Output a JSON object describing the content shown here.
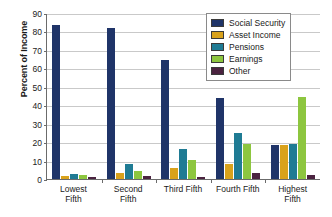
{
  "chart_data": {
    "type": "bar",
    "title": "",
    "xlabel": "",
    "ylabel": "Percent of Income",
    "ylim": [
      0,
      90
    ],
    "yticks": [
      0,
      10,
      20,
      30,
      40,
      50,
      60,
      70,
      80,
      90
    ],
    "grid": true,
    "legend_position": "top-right",
    "categories": [
      "Lowest Fifth",
      "Second Fifth",
      "Third Fifth",
      "Fourth Fifth",
      "Highest Fifth"
    ],
    "category_lines": [
      [
        "Lowest",
        "Fifth"
      ],
      [
        "Second",
        "Fifth"
      ],
      [
        "Third Fifth",
        ""
      ],
      [
        "Fourth Fifth",
        ""
      ],
      [
        "Highest",
        "Fifth"
      ]
    ],
    "series": [
      {
        "name": "Social Security",
        "color": "#1F3468",
        "values": [
          83.5,
          82.0,
          64.5,
          43.8,
          18.2
        ]
      },
      {
        "name": "Asset Income",
        "color": "#D9A21B",
        "values": [
          1.9,
          3.0,
          6.2,
          8.2,
          18.4
        ]
      },
      {
        "name": "Pensions",
        "color": "#1F7B94",
        "values": [
          2.9,
          8.1,
          16.2,
          25.2,
          19.1
        ]
      },
      {
        "name": "Earnings",
        "color": "#8DC63F",
        "values": [
          2.0,
          4.1,
          10.2,
          19.2,
          44.3
        ]
      },
      {
        "name": "Other",
        "color": "#4B2340",
        "values": [
          1.0,
          1.9,
          1.0,
          3.1,
          2.1
        ]
      }
    ]
  }
}
